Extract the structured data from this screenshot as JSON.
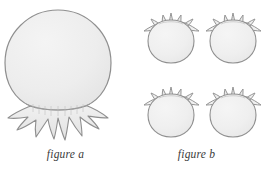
{
  "illustration": {
    "background_color": "#ffffff",
    "shape_fill": "#ececec",
    "shape_fill_light": "#f3f3f3",
    "shape_stroke": "#8f8f8f",
    "caption_color": "#3a3a3a",
    "shading_color": "#d9d9d9"
  },
  "panel_a": {
    "caption": "figure a",
    "shape_name": "pomegranate",
    "count": 1,
    "orientation": "calyx-bottom",
    "figures": [
      {
        "cx": 58,
        "cy": 66,
        "rx": 53,
        "ry": 56,
        "scale": 1.0
      }
    ]
  },
  "panel_b": {
    "caption": "figure b",
    "shape_name": "pomegranate",
    "count": 4,
    "orientation": "calyx-top",
    "figures": [
      {
        "cx": 40,
        "cy": 39,
        "rx": 22,
        "ry": 23,
        "scale": 0.42
      },
      {
        "cx": 102,
        "cy": 39,
        "rx": 22,
        "ry": 23,
        "scale": 0.42
      },
      {
        "cx": 40,
        "cy": 113,
        "rx": 22,
        "ry": 23,
        "scale": 0.42
      },
      {
        "cx": 102,
        "cy": 113,
        "rx": 22,
        "ry": 23,
        "scale": 0.42
      }
    ]
  }
}
